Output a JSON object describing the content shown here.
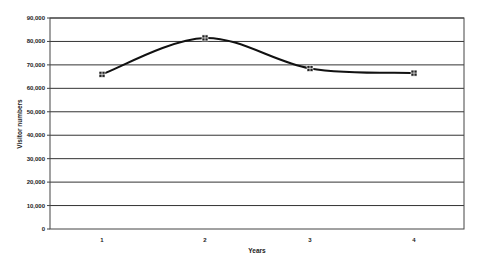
{
  "chart_data": {
    "type": "line",
    "title": "",
    "xlabel": "Years",
    "ylabel": "Visitor numbers",
    "categories": [
      "1",
      "2",
      "3",
      "4"
    ],
    "series": [
      {
        "name": "Visitor numbers",
        "values": [
          66000,
          81500,
          68500,
          66500
        ],
        "smooth": true,
        "marker": "square"
      }
    ],
    "ylim": [
      0,
      90000
    ],
    "yticks": [
      0,
      10000,
      20000,
      30000,
      40000,
      50000,
      60000,
      70000,
      80000,
      90000
    ],
    "ytick_labels": [
      "0",
      "10,000",
      "20,000",
      "30,000",
      "40,000",
      "50,000",
      "60,000",
      "70,000",
      "80,000",
      "90,000"
    ],
    "grid": true,
    "legend": "none"
  },
  "colors": {
    "line": "#111111",
    "grid": "#333333",
    "background": "#ffffff"
  }
}
